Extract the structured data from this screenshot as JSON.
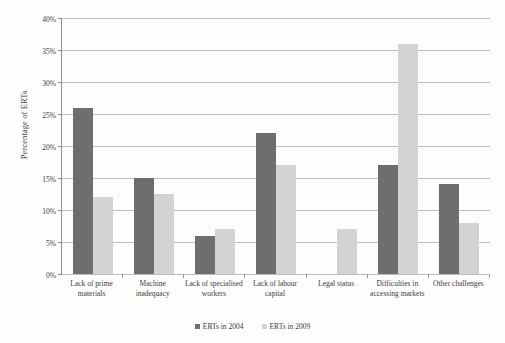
{
  "chart_data": {
    "type": "bar",
    "title": "",
    "subtitle": "",
    "xlabel": "",
    "ylabel": "Percentage of ERTs",
    "ylim": [
      0,
      40
    ],
    "ytick_labels": [
      "0%",
      "5%",
      "10%",
      "15%",
      "20%",
      "25%",
      "30%",
      "35%",
      "40%"
    ],
    "ytick_values": [
      0,
      5,
      10,
      15,
      20,
      25,
      30,
      35,
      40
    ],
    "grid": true,
    "legend_position": "bottom",
    "categories": [
      "Lack of prime materials",
      "Machine inadequacy",
      "Lack of specialised workers",
      "Lack of labour capital",
      "Legal status",
      "Difficulties in accessing markets",
      "Other challenges"
    ],
    "series": [
      {
        "name": "ERTs in 2004",
        "color": "#6e6e6e",
        "values": [
          26,
          15,
          6,
          22,
          null,
          17,
          14
        ]
      },
      {
        "name": "ERTs in 2009",
        "color": "#d3d3d3",
        "values": [
          12,
          12.5,
          7,
          17,
          7,
          36,
          8
        ]
      }
    ]
  },
  "legend": {
    "items": [
      {
        "label": "ERTs in 2004",
        "swatch": "legend-swatch-2004"
      },
      {
        "label": "ERTs in 2009",
        "swatch": "legend-swatch-2009"
      }
    ]
  }
}
